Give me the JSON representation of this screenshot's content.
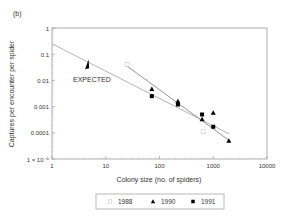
{
  "chart_data": {
    "type": "scatter",
    "panel_label": "(b)",
    "title": "",
    "xlabel": "Colony size (no. of spiders)",
    "ylabel": "Captures per encounter per spider",
    "xscale": "log",
    "yscale": "log",
    "xlim": [
      1,
      10000
    ],
    "ylim": [
      1e-05,
      1
    ],
    "x_ticks": [
      1,
      10,
      100,
      1000,
      10000
    ],
    "x_tick_labels": [
      "1",
      "10",
      "100",
      "1000",
      "10000"
    ],
    "y_ticks": [
      1,
      0.1,
      0.01,
      0.001,
      0.0001,
      1e-05
    ],
    "y_tick_labels": [
      "1",
      "0.1",
      "0.01",
      "0.001",
      "0.0001",
      "1 × 10⁻⁵"
    ],
    "grid": false,
    "legend_position": "bottom",
    "series": [
      {
        "name": "1988",
        "marker": "open-square",
        "color": "#c8c8c8",
        "points": [
          [
            25,
            0.04
          ],
          [
            650,
            0.00011
          ]
        ]
      },
      {
        "name": "1990",
        "marker": "triangle",
        "color": "#000000",
        "points": [
          [
            72,
            0.0047
          ],
          [
            220,
            0.0016
          ],
          [
            620,
            0.00033
          ],
          [
            1000,
            0.00058
          ],
          [
            1950,
            5e-05
          ]
        ]
      },
      {
        "name": "1991",
        "marker": "square",
        "color": "#000000",
        "points": [
          [
            72,
            0.0025
          ],
          [
            220,
            0.0012
          ],
          [
            620,
            0.0005
          ],
          [
            1000,
            0.00017
          ]
        ]
      }
    ],
    "lines": [
      {
        "name": "expected",
        "color": "#aaaaaa",
        "from": [
          1,
          0.25
        ],
        "to": [
          2000,
          9e-05
        ]
      },
      {
        "name": "fit",
        "color": "#888888",
        "from": [
          25,
          0.035
        ],
        "to": [
          2000,
          5e-05
        ]
      }
    ],
    "annotations": [
      {
        "text": "EXPECTED",
        "arrow_at": [
          4.5,
          0.045
        ]
      }
    ]
  },
  "legend": {
    "items": [
      {
        "label": "1988",
        "marker": "open-square"
      },
      {
        "label": "1990",
        "marker": "triangle"
      },
      {
        "label": "1991",
        "marker": "square"
      }
    ]
  }
}
